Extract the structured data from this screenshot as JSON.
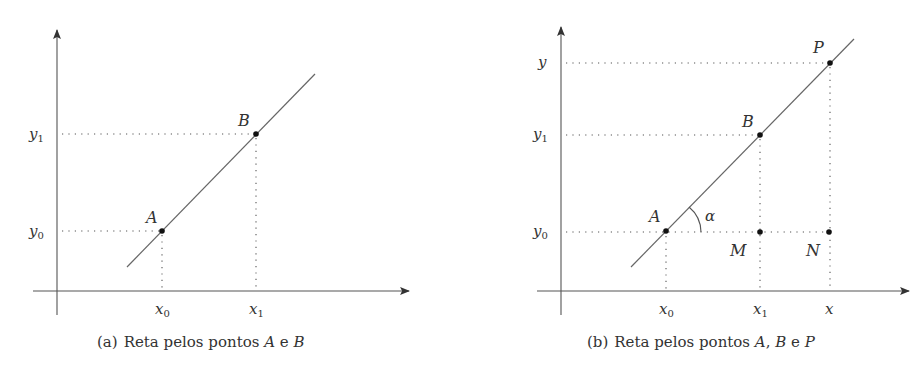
{
  "figures": [
    {
      "id": "a",
      "caption": {
        "tag": "(a)",
        "text": "Reta pelos pontos ",
        "p1": "A",
        "mid": " e ",
        "p2": "B"
      },
      "axes": {
        "x_ticks": [
          "x0",
          "x1"
        ],
        "y_ticks": [
          "y0",
          "y1"
        ]
      },
      "points": [
        {
          "label": "A",
          "coords": "(x0, y0)"
        },
        {
          "label": "B",
          "coords": "(x1, y1)"
        }
      ],
      "labels": {
        "y1": {
          "base": "y",
          "sub": "1"
        },
        "y0": {
          "base": "y",
          "sub": "0"
        },
        "x0": {
          "base": "x",
          "sub": "0"
        },
        "x1": {
          "base": "x",
          "sub": "1"
        },
        "A": "A",
        "B": "B"
      }
    },
    {
      "id": "b",
      "caption": {
        "tag": "(b)",
        "text": "Reta pelos pontos ",
        "p1": "A",
        "sep": ", ",
        "p2": "B",
        "mid": " e ",
        "p3": "P"
      },
      "axes": {
        "x_ticks": [
          "x0",
          "x1",
          "x"
        ],
        "y_ticks": [
          "y0",
          "y1",
          "y"
        ]
      },
      "points": [
        {
          "label": "A",
          "coords": "(x0, y0)"
        },
        {
          "label": "B",
          "coords": "(x1, y1)"
        },
        {
          "label": "P",
          "coords": "(x, y)"
        },
        {
          "label": "M",
          "coords": "(x1, y0)"
        },
        {
          "label": "N",
          "coords": "(x, y0)"
        }
      ],
      "angle_label": "α",
      "labels": {
        "y": "y",
        "y1": {
          "base": "y",
          "sub": "1"
        },
        "y0": {
          "base": "y",
          "sub": "0"
        },
        "x0": {
          "base": "x",
          "sub": "0"
        },
        "x1": {
          "base": "x",
          "sub": "1"
        },
        "x": "x",
        "A": "A",
        "B": "B",
        "P": "P",
        "M": "M",
        "N": "N"
      }
    }
  ],
  "colors": {
    "line": "#555555",
    "axis": "#444444",
    "point": "#111111",
    "dotted": "#555555"
  }
}
